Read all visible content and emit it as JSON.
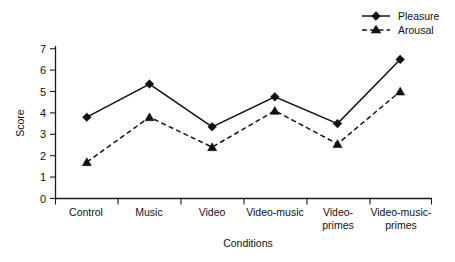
{
  "chart_data": {
    "type": "line",
    "title": "",
    "subtitle": "",
    "xlabel": "Conditions",
    "ylabel": "Score",
    "categories": [
      "Control",
      "Music",
      "Video",
      "Video-music",
      "Video-primes",
      "Video-music-primes"
    ],
    "category_lines": [
      [
        "Control"
      ],
      [
        "Music"
      ],
      [
        "Video"
      ],
      [
        "Video-music"
      ],
      [
        "Video-",
        "primes"
      ],
      [
        "Video-music-",
        "primes"
      ]
    ],
    "series": [
      {
        "name": "Pleasure",
        "values": [
          3.8,
          5.35,
          3.35,
          4.75,
          3.5,
          6.5
        ],
        "marker": "diamond",
        "linestyle": "solid",
        "color": "#111111"
      },
      {
        "name": "Arousal",
        "values": [
          1.7,
          3.8,
          2.4,
          4.1,
          2.55,
          5.0
        ],
        "marker": "triangle",
        "linestyle": "dashed",
        "color": "#111111"
      }
    ],
    "ylim": [
      0,
      7
    ],
    "yticks": [
      0,
      1,
      2,
      3,
      4,
      5,
      6,
      7
    ],
    "ytick_labels": [
      "0",
      "1",
      "2",
      "3",
      "4",
      "5",
      "6",
      "7"
    ],
    "grid": false,
    "legend_position": "top-right",
    "frame": "left-bottom"
  },
  "legend": {
    "entries": [
      {
        "label": "Pleasure",
        "marker": "diamond-marker-icon",
        "linestyle": "solid"
      },
      {
        "label": "Arousal",
        "marker": "triangle-marker-icon",
        "linestyle": "dashed"
      }
    ]
  }
}
